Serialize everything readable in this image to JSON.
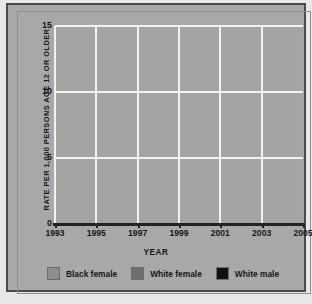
{
  "chart_data": {
    "type": "line",
    "title": "",
    "xlabel": "YEAR",
    "ylabel": "RATE PER 1,000 PERSONS AGE 12 OR OLDER",
    "x": [
      1993,
      1994,
      1995,
      1996,
      1997,
      1998,
      1999,
      2000,
      2001,
      2002,
      2003,
      2004
    ],
    "xlim": [
      1993,
      2005
    ],
    "ylim": [
      0,
      15
    ],
    "xticks": [
      "1993",
      "1995",
      "1997",
      "1999",
      "2001",
      "2003",
      "2005"
    ],
    "xtick_values": [
      1993,
      1995,
      1997,
      1999,
      2001,
      2003,
      2005
    ],
    "yticks": [
      "0",
      "5",
      "10",
      "15"
    ],
    "ytick_values": [
      0,
      5,
      10,
      15
    ],
    "grid": "white gridlines, horizontal at 5/10/15 and vertical at odd years",
    "legend_position": "bottom-center",
    "series": [
      {
        "name": "Black female",
        "color": "#8a8a8a",
        "values": [
          12.3,
          12.5,
          13.3,
          12.3,
          9.2,
          8.4,
          7.7,
          4.4,
          4.9,
          4.0,
          3.9,
          5.6
        ]
      },
      {
        "name": "White female",
        "color": "#6e6e6e",
        "values": [
          10.0,
          8.7,
          7.3,
          6.8,
          7.1,
          7.2,
          5.5,
          4.4,
          4.9,
          4.0,
          4.3,
          3.4
        ]
      },
      {
        "name": "White male",
        "color": "#141414",
        "values": [
          1.5,
          1.8,
          1.6,
          1.4,
          1.2,
          1.5,
          1.1,
          0.8,
          0.9,
          0.9,
          0.5,
          0.9
        ]
      }
    ]
  },
  "axes": {
    "y_title": "RATE PER 1,000 PERSONS AGE 12 OR OLDER",
    "x_title": "YEAR"
  },
  "legend": {
    "items": [
      {
        "label": "Black female",
        "color": "#8e8e8e"
      },
      {
        "label": "White female",
        "color": "#6f6f6f"
      },
      {
        "label": "White male",
        "color": "#111111"
      }
    ]
  },
  "colors": {
    "panel": "#a8a8a8",
    "plot": "#a4a4a4",
    "grid": "#f2f2ef",
    "axis": "#232326",
    "page": "#e8e8e6"
  },
  "footnote": ""
}
